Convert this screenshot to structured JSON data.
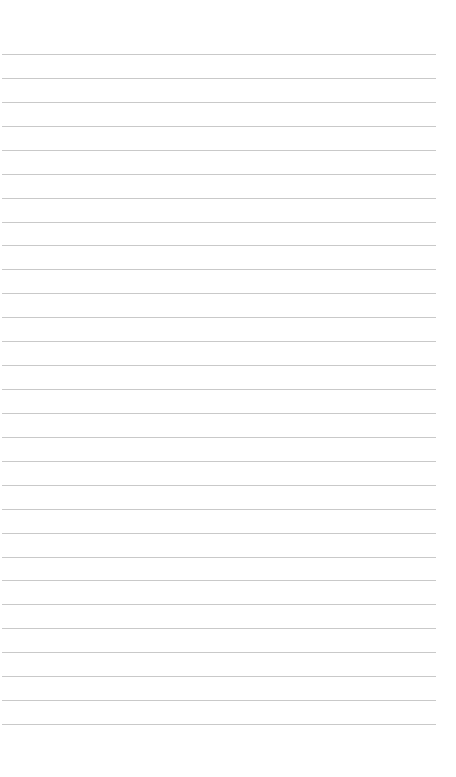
{
  "page": {
    "type": "blank ruled notebook page",
    "line_count": 29,
    "first_line_y": 54,
    "line_spacing": 23.93,
    "line_left": 2,
    "line_width": 434,
    "line_color": "#c9c9c9",
    "background_color": "#ffffff"
  }
}
